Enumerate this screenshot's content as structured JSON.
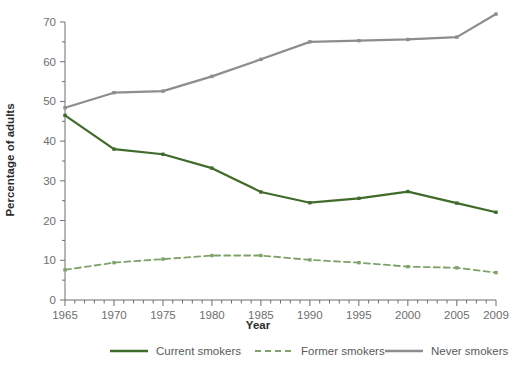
{
  "chart_data": {
    "type": "line",
    "title": "",
    "xlabel": "Year",
    "ylabel": "Percentage of adults",
    "x": [
      1965,
      1970,
      1975,
      1980,
      1985,
      1990,
      1995,
      2000,
      2005,
      2009
    ],
    "xlim": [
      1965,
      2009
    ],
    "ylim": [
      0,
      70
    ],
    "ytick_values": [
      0,
      10,
      20,
      30,
      40,
      50,
      60,
      70
    ],
    "ytick_labels": [
      "0",
      "10",
      "20",
      "30",
      "40",
      "50",
      "60",
      "70"
    ],
    "xtick_labels": [
      "1965",
      "1970",
      "1975",
      "1980",
      "1985",
      "1990",
      "1995",
      "2000",
      "2005",
      "2009"
    ],
    "minor_tick_interval": 1,
    "grid": false,
    "legend_position": "bottom",
    "series": [
      {
        "name": "Current smokers",
        "color": "#3f6b2b",
        "style": "solid",
        "values": [
          46.5,
          38.0,
          36.7,
          33.2,
          27.2,
          24.5,
          25.6,
          27.3,
          24.4,
          22.1
        ]
      },
      {
        "name": "Former smokers",
        "color": "#7fa26a",
        "style": "dashed",
        "values": [
          7.6,
          9.4,
          10.3,
          11.2,
          11.2,
          10.1,
          9.4,
          8.4,
          8.1,
          6.9
        ]
      },
      {
        "name": "Never smokers",
        "color": "#8d8d8d",
        "style": "solid",
        "values": [
          48.4,
          52.2,
          52.6,
          56.3,
          60.6,
          65.0,
          65.3,
          65.6,
          66.2,
          72.0
        ]
      }
    ]
  },
  "legend": {
    "items": [
      {
        "label": "Current smokers",
        "color": "#3f6b2b",
        "style": "solid"
      },
      {
        "label": "Former smokers",
        "color": "#7fa26a",
        "style": "dashed"
      },
      {
        "label": "Never smokers",
        "color": "#8d8d8d",
        "style": "solid"
      }
    ]
  },
  "axis": {
    "y_title": "Percentage of adults",
    "x_title": "Year"
  },
  "colors": {
    "current": "#3f6b2b",
    "former": "#7fa26a",
    "never": "#8d8d8d",
    "axis": "#6e6e6e",
    "text": "#2b2b2b",
    "background": "#ffffff"
  }
}
